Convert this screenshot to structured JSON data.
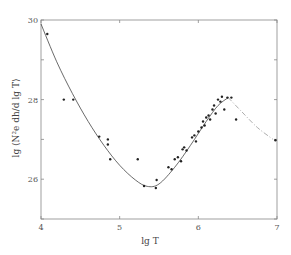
{
  "chart_data": {
    "type": "scatter",
    "title": "",
    "xlabel": "lg T",
    "ylabel": "lg ⟨N²e dh/d lg T⟩",
    "xlim": [
      4,
      7
    ],
    "ylim": [
      25,
      30
    ],
    "x_ticks": [
      "4",
      "5",
      "6",
      "7"
    ],
    "y_ticks": [
      "26",
      "28",
      "30"
    ],
    "grid": false,
    "legend": null,
    "series": [
      {
        "name": "observations",
        "kind": "points",
        "points": [
          [
            4.08,
            29.65
          ],
          [
            4.29,
            28.0
          ],
          [
            4.41,
            28.0
          ],
          [
            4.74,
            27.07
          ],
          [
            4.85,
            27.0
          ],
          [
            4.85,
            26.87
          ],
          [
            4.88,
            26.5
          ],
          [
            5.23,
            26.5
          ],
          [
            5.31,
            25.83
          ],
          [
            5.46,
            25.78
          ],
          [
            5.47,
            25.98
          ],
          [
            5.62,
            26.3
          ],
          [
            5.66,
            26.25
          ],
          [
            5.7,
            26.5
          ],
          [
            5.74,
            26.55
          ],
          [
            5.78,
            26.45
          ],
          [
            5.8,
            26.75
          ],
          [
            5.82,
            26.8
          ],
          [
            5.85,
            26.72
          ],
          [
            5.92,
            27.05
          ],
          [
            5.95,
            27.1
          ],
          [
            5.97,
            26.95
          ],
          [
            6.0,
            27.2
          ],
          [
            6.04,
            27.3
          ],
          [
            6.06,
            27.45
          ],
          [
            6.08,
            27.35
          ],
          [
            6.1,
            27.55
          ],
          [
            6.13,
            27.6
          ],
          [
            6.15,
            27.5
          ],
          [
            6.18,
            27.75
          ],
          [
            6.2,
            27.85
          ],
          [
            6.22,
            27.65
          ],
          [
            6.25,
            28.0
          ],
          [
            6.28,
            27.95
          ],
          [
            6.3,
            28.07
          ],
          [
            6.33,
            27.75
          ],
          [
            6.37,
            28.05
          ],
          [
            6.42,
            28.05
          ],
          [
            6.48,
            27.5
          ],
          [
            6.98,
            26.98
          ]
        ]
      },
      {
        "name": "fit (solid)",
        "kind": "curve",
        "points": [
          [
            4.0,
            29.9
          ],
          [
            4.2,
            28.95
          ],
          [
            4.4,
            28.15
          ],
          [
            4.6,
            27.45
          ],
          [
            4.8,
            26.85
          ],
          [
            5.0,
            26.35
          ],
          [
            5.2,
            25.98
          ],
          [
            5.35,
            25.82
          ],
          [
            5.5,
            25.88
          ],
          [
            5.7,
            26.3
          ],
          [
            5.9,
            26.85
          ],
          [
            6.1,
            27.45
          ],
          [
            6.25,
            27.85
          ],
          [
            6.38,
            28.05
          ]
        ]
      },
      {
        "name": "extrapolation (dashed)",
        "kind": "dashed-curve",
        "points": [
          [
            6.38,
            28.05
          ],
          [
            6.55,
            27.7
          ],
          [
            6.75,
            27.3
          ],
          [
            6.95,
            27.0
          ]
        ]
      }
    ]
  }
}
